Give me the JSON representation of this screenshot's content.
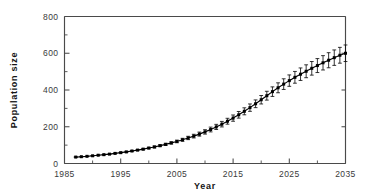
{
  "chart_data": {
    "type": "line",
    "title": "",
    "xlabel": "Year",
    "ylabel": "Population size",
    "xlim": [
      1985,
      2035
    ],
    "ylim": [
      0,
      800
    ],
    "grid": false,
    "legend": null,
    "x_ticks": [
      1985,
      1995,
      2005,
      2015,
      2025,
      2035
    ],
    "x_tick_labels": [
      "1985",
      "1995",
      "2005",
      "2015",
      "2025",
      "2035"
    ],
    "x_minor_ticks": [
      1990,
      2000,
      2010,
      2020,
      2030
    ],
    "y_ticks": [
      0,
      200,
      400,
      600,
      800
    ],
    "y_tick_labels": [
      "0",
      "200",
      "400",
      "600",
      "800"
    ],
    "y_minor_ticks": [
      100,
      300,
      500,
      700
    ],
    "marker": "filled-square",
    "error_bars": "vertical-with-caps",
    "series": [
      {
        "name": "Population size",
        "x": [
          1987,
          1988,
          1989,
          1990,
          1991,
          1992,
          1993,
          1994,
          1995,
          1996,
          1997,
          1998,
          1999,
          2000,
          2001,
          2002,
          2003,
          2004,
          2005,
          2006,
          2007,
          2008,
          2009,
          2010,
          2011,
          2012,
          2013,
          2014,
          2015,
          2016,
          2017,
          2018,
          2019,
          2020,
          2021,
          2022,
          2023,
          2024,
          2025,
          2026,
          2027,
          2028,
          2029,
          2030,
          2031,
          2032,
          2033,
          2034,
          2035
        ],
        "values": [
          35,
          37,
          39,
          42,
          45,
          48,
          51,
          55,
          59,
          63,
          68,
          73,
          78,
          84,
          90,
          97,
          104,
          112,
          120,
          129,
          139,
          149,
          160,
          172,
          185,
          199,
          214,
          230,
          247,
          265,
          284,
          304,
          325,
          347,
          369,
          391,
          412,
          432,
          451,
          469,
          486,
          502,
          518,
          533,
          548,
          562,
          576,
          589,
          600
        ],
        "errors": [
          1,
          1,
          1,
          1,
          1,
          2,
          2,
          2,
          2,
          3,
          3,
          3,
          4,
          4,
          5,
          5,
          6,
          6,
          7,
          8,
          9,
          10,
          11,
          12,
          13,
          14,
          15,
          16,
          17,
          18,
          19,
          20,
          21,
          23,
          24,
          26,
          27,
          29,
          31,
          32,
          34,
          35,
          37,
          38,
          39,
          41,
          42,
          43,
          45
        ]
      }
    ]
  },
  "labels": {
    "y_axis_title": "Population size",
    "x_axis_title": "Year"
  },
  "colors": {
    "line": "#000000",
    "axis": "#4a4a4a",
    "background": "#ffffff",
    "tick_label": "#3a3a3a"
  }
}
